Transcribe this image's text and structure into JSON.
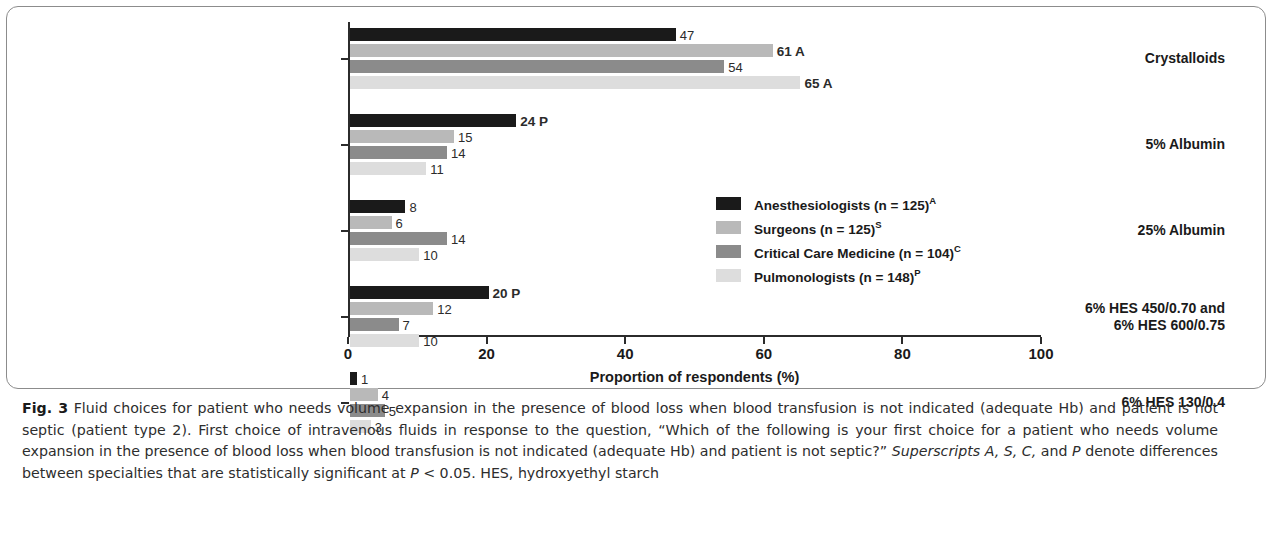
{
  "chart_data": {
    "type": "bar",
    "orientation": "horizontal",
    "title": "",
    "xlabel": "Proportion of respondents (%)",
    "ylabel": "",
    "xlim": [
      0,
      100
    ],
    "xticks": [
      "0",
      "20",
      "40",
      "60",
      "80",
      "100"
    ],
    "grid": false,
    "legend_position": "middle-right",
    "categories": [
      "Crystalloids",
      "5% Albumin",
      "25% Albumin",
      "6% HES 450/0.70 and\n6% HES 600/0.75",
      "6% HES 130/0.4"
    ],
    "category_lines": [
      [
        "Crystalloids"
      ],
      [
        "5% Albumin"
      ],
      [
        "25% Albumin"
      ],
      [
        "6% HES 450/0.70 and",
        "6% HES 600/0.75"
      ],
      [
        "6% HES 130/0.4"
      ]
    ],
    "series": [
      {
        "name": "Anesthesiologists (n = 125)",
        "superscript": "A",
        "color": "#1a1a1a",
        "values": [
          47,
          24,
          8,
          20,
          1
        ],
        "labels": [
          "47",
          "24 P",
          "8",
          "20 P",
          "1"
        ]
      },
      {
        "name": "Surgeons (n = 125)",
        "superscript": "S",
        "color": "#b9b9b9",
        "values": [
          61,
          15,
          6,
          12,
          4
        ],
        "labels": [
          "61 A",
          "15",
          "6",
          "12",
          "4"
        ]
      },
      {
        "name": "Critical Care Medicine (n = 104)",
        "superscript": "C",
        "color": "#8b8b8b",
        "values": [
          54,
          14,
          14,
          7,
          5
        ],
        "labels": [
          "54",
          "14",
          "14",
          "7",
          "5"
        ]
      },
      {
        "name": "Pulmonologists (n = 148)",
        "superscript": "P",
        "color": "#dddddd",
        "values": [
          65,
          11,
          10,
          10,
          3
        ],
        "labels": [
          "65 A",
          "11",
          "10",
          "10",
          "3"
        ]
      }
    ]
  },
  "legend": {
    "items": [
      {
        "label": "Anesthesiologists (n = 125)",
        "sup": "A",
        "color": "#1a1a1a"
      },
      {
        "label": "Surgeons (n = 125)",
        "sup": "S",
        "color": "#b9b9b9"
      },
      {
        "label": "Critical Care Medicine (n = 104)",
        "sup": "C",
        "color": "#8b8b8b"
      },
      {
        "label": "Pulmonologists (n = 148)",
        "sup": "P",
        "color": "#dddddd"
      }
    ]
  },
  "caption": {
    "figure_number": "Fig. 3",
    "text_1": " Fluid choices for patient who needs volume expansion in the presence of blood loss when blood transfusion is not indicated (adequate Hb) and patient is not septic (patient type 2). First choice of intravenous fluids in response to the question, “Which of the following is your first choice for a patient who needs volume expansion in the presence of blood loss when blood transfusion is not indicated (adequate Hb) and patient is not septic?” ",
    "italic_1": "Superscripts A, S, C,",
    "text_2": " and ",
    "italic_2": "P",
    "text_3": " denote differences between specialties that are statistically significant at ",
    "italic_3": "P",
    "text_4": " < 0.05. HES, hydroxyethyl starch"
  }
}
